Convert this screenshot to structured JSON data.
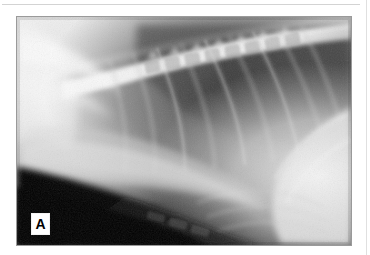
{
  "figure": {
    "panel_letter": "A",
    "caption": "",
    "modality_label": "radiograph",
    "view": "lateral thoracic radiograph",
    "border_color": "#9a9a9a",
    "label_bg": "#ffffff",
    "label_fg": "#000000"
  },
  "page": {
    "background": "#ffffff",
    "rule_color": "#d3d3d3",
    "right_rule_color": "#e0e0e0"
  },
  "image_regions": {
    "lung_field": "dark radiolucent caudodorsal lung field",
    "spine": "thoracic vertebral column, dorsal",
    "ribs": "rib cage arcs crossing lung field",
    "diaphragm": "bright diaphragmatic / hepatic silhouette, caudal",
    "sternum": "radiopaque ventral sternal region",
    "scapula": "cranial shoulder / scapular overlap, bright"
  },
  "icons": {
    "panel_label": "letter-a-marker"
  }
}
